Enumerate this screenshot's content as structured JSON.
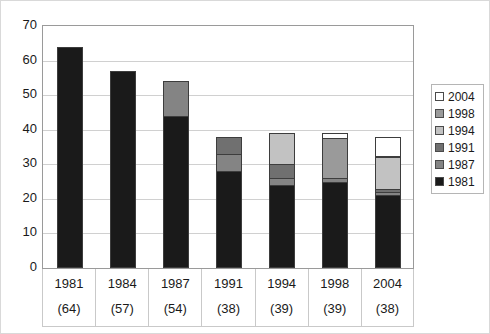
{
  "chart_data": {
    "type": "bar",
    "title": "",
    "subtitle": "",
    "xlabel": "",
    "ylabel": "",
    "stacked": true,
    "grid": true,
    "legend_position": "right",
    "ylim": [
      0,
      70
    ],
    "ytick_step": 10,
    "yticks": [
      "70",
      "60",
      "50",
      "40",
      "30",
      "20",
      "10",
      "0"
    ],
    "categories": [
      "1981",
      "1984",
      "1987",
      "1991",
      "1994",
      "1998",
      "2004"
    ],
    "category_counts": [
      "(64)",
      "(57)",
      "(54)",
      "(38)",
      "(39)",
      "(39)",
      "(38)"
    ],
    "totals": [
      64,
      57,
      54,
      38,
      39,
      39,
      38
    ],
    "series": [
      {
        "name": "1981",
        "color": "#1a1a1a",
        "values": [
          64,
          57,
          44,
          28,
          24,
          25,
          21
        ]
      },
      {
        "name": "1987",
        "color": "#848484",
        "values": [
          0,
          0,
          10,
          5,
          2,
          1,
          1
        ]
      },
      {
        "name": "1991",
        "color": "#707070",
        "values": [
          0,
          0,
          0,
          5,
          4,
          0,
          1
        ]
      },
      {
        "name": "1994",
        "color": "#c2c2c2",
        "values": [
          0,
          0,
          0,
          0,
          9,
          0,
          9
        ]
      },
      {
        "name": "1998",
        "color": "#9a9a9a",
        "values": [
          0,
          0,
          0,
          0,
          0,
          11.5,
          0.5
        ]
      },
      {
        "name": "2004",
        "color": "#ffffff",
        "values": [
          0,
          0,
          0,
          0,
          0,
          1.5,
          5.5
        ]
      }
    ],
    "legend_entries": [
      {
        "label": "2004",
        "color": "#ffffff"
      },
      {
        "label": "1998",
        "color": "#9a9a9a"
      },
      {
        "label": "1994",
        "color": "#c2c2c2"
      },
      {
        "label": "1991",
        "color": "#707070"
      },
      {
        "label": "1987",
        "color": "#848484"
      },
      {
        "label": "1981",
        "color": "#1a1a1a"
      }
    ]
  }
}
